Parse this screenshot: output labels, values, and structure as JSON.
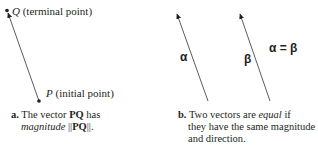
{
  "panel_a": {
    "terminal_point": {
      "letter": "Q",
      "desc": "(terminal point)"
    },
    "initial_point": {
      "letter": "P",
      "desc": "(initial point)"
    },
    "caption": {
      "marker": "a.",
      "line1_pre": "The vector ",
      "line1_bold": "PQ",
      "line1_post": " has",
      "line2_italic": "magnitude",
      "line2_pre": " ||",
      "line2_bold": "PQ",
      "line2_post": "||."
    }
  },
  "panel_b": {
    "vector1_label": "α",
    "vector2_label": "β",
    "equation": "α = β",
    "caption": {
      "marker": "b.",
      "line1_pre": "Two vectors are ",
      "line1_italic": "equal",
      "line1_post": " if",
      "line2": "they have the same magnitude",
      "line3": "and direction."
    }
  },
  "colors": {
    "ink": "#231f20",
    "line": "#4a4a4a"
  }
}
